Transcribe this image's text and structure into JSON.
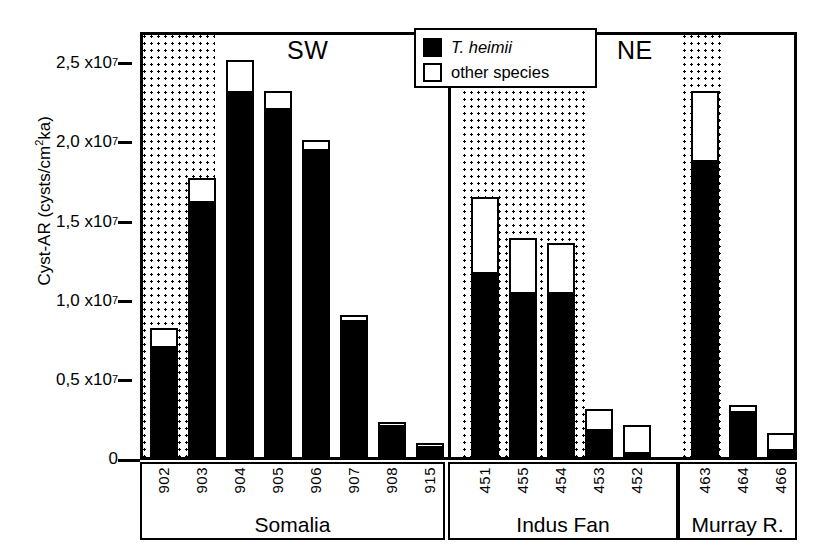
{
  "axis": {
    "y_title_main": "Cyst-AR (cysts/cm",
    "y_title_sup": "2",
    "y_title_tail": "ka)",
    "y_title_full": "Cyst-AR (cysts/cm2ka)",
    "ticks": [
      {
        "label_mantissa": "2,5 x10",
        "exp": "7",
        "value": 25000000
      },
      {
        "label_mantissa": "2,0 x10",
        "exp": "7",
        "value": 20000000
      },
      {
        "label_mantissa": "1,5 x10",
        "exp": "7",
        "value": 15000000
      },
      {
        "label_mantissa": "1,0 x10",
        "exp": "7",
        "value": 10000000
      },
      {
        "label_mantissa": "0,5 x10",
        "exp": "7",
        "value": 5000000
      },
      {
        "label_mantissa": "0",
        "exp": "",
        "value": 0
      }
    ]
  },
  "legend": {
    "items": [
      {
        "label": "T. heimii",
        "style": "filled",
        "italic": true,
        "color": "#000000"
      },
      {
        "label": "other species",
        "style": "open",
        "italic": false,
        "color": "#ffffff"
      }
    ]
  },
  "regions": [
    {
      "name": "SW",
      "x": 287,
      "y": 36
    },
    {
      "name": "NE",
      "x": 617,
      "y": 36
    }
  ],
  "groups": [
    {
      "name": "Somalia",
      "sites": [
        "902",
        "903",
        "904",
        "905",
        "906",
        "907",
        "908",
        "915"
      ]
    },
    {
      "name": "Indus Fan",
      "sites": [
        "451",
        "455",
        "454",
        "453",
        "452"
      ]
    },
    {
      "name": "Murray R.",
      "sites": [
        "463",
        "464",
        "466"
      ]
    }
  ],
  "chart_data": {
    "type": "bar",
    "subtype": "stacked",
    "title": "",
    "xlabel": "",
    "ylabel": "Cyst-AR (cysts/cm2ka)",
    "ylim": [
      0,
      27800000
    ],
    "grid": false,
    "legend_position": "top-center",
    "categories": [
      "902",
      "903",
      "904",
      "905",
      "906",
      "907",
      "908",
      "915",
      "451",
      "455",
      "454",
      "453",
      "452",
      "463",
      "464",
      "466"
    ],
    "groups": [
      "Somalia",
      "Somalia",
      "Somalia",
      "Somalia",
      "Somalia",
      "Somalia",
      "Somalia",
      "Somalia",
      "Indus Fan",
      "Indus Fan",
      "Indus Fan",
      "Indus Fan",
      "Indus Fan",
      "Murray R.",
      "Murray R.",
      "Murray R."
    ],
    "regions": [
      "SW",
      "SW",
      "SW",
      "SW",
      "SW",
      "SW",
      "SW",
      "SW",
      "NE",
      "NE",
      "NE",
      "NE",
      "NE",
      "NE",
      "NE",
      "NE"
    ],
    "series": [
      {
        "name": "T. heimii",
        "color": "#000000",
        "values": [
          7200000,
          16600000,
          23800000,
          22700000,
          20000000,
          8900000,
          2100000,
          700000,
          12000000,
          10700000,
          10700000,
          1800000,
          350000,
          19300000,
          3000000,
          550000
        ]
      },
      {
        "name": "other species",
        "color": "#ffffff",
        "values": [
          1200000,
          1500000,
          2000000,
          1100000,
          600000,
          300000,
          200000,
          200000,
          4900000,
          3500000,
          3200000,
          1300000,
          1750000,
          4500000,
          400000,
          1000000
        ]
      }
    ],
    "totals": [
      8400000,
      18100000,
      25800000,
      23800000,
      20600000,
      9200000,
      2300000,
      900000,
      16900000,
      14200000,
      13900000,
      3100000,
      2100000,
      23800000,
      3400000,
      1550000
    ],
    "shaded_bands": [
      {
        "label": "glacial-band-somalia",
        "sites": [
          "902",
          "903"
        ]
      },
      {
        "label": "glacial-band-indus",
        "sites": [
          "451",
          "455",
          "454",
          "453"
        ]
      },
      {
        "label": "glacial-band-murray",
        "sites": [
          "463"
        ]
      }
    ]
  }
}
